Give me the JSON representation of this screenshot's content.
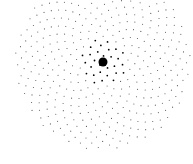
{
  "chart_data": {
    "type": "scatter",
    "title": "",
    "xlabel": "",
    "ylabel": "",
    "grid": false,
    "legend": null,
    "pattern": {
      "n_points": 420,
      "golden_angle_deg": 137.508,
      "center_px": [
        103,
        62
      ],
      "scale_px": 4.3,
      "max_radius_px": 88
    },
    "style": {
      "point_color": "#555555",
      "point_radius_px": 0.55,
      "center_color": "#000000",
      "background": "#ffffff"
    }
  }
}
